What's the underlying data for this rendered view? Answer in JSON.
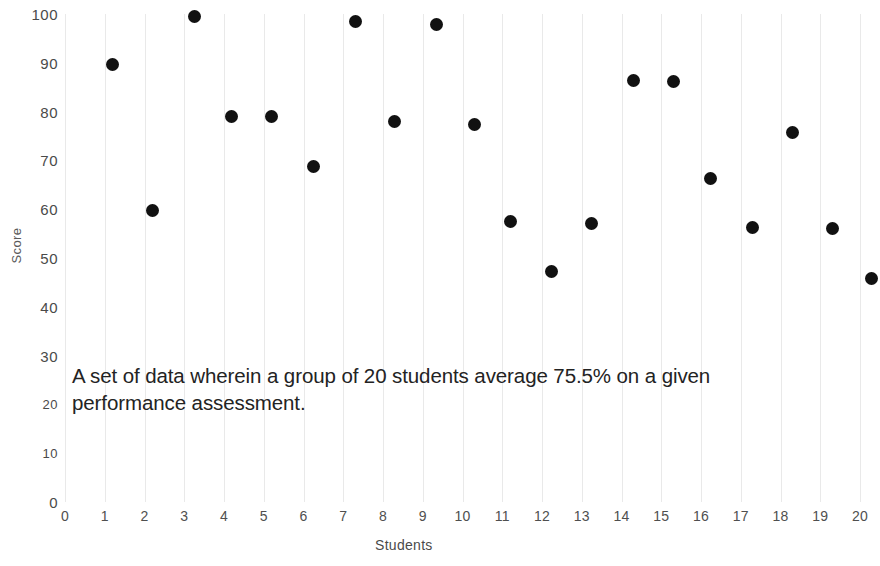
{
  "chart_data": {
    "type": "scatter",
    "title": "",
    "xlabel": "Students",
    "ylabel": "Score",
    "xlim": [
      0,
      20
    ],
    "ylim": [
      0,
      100
    ],
    "grid": "vertical",
    "legend": "none",
    "x_ticks": [
      "0",
      "1",
      "2",
      "3",
      "4",
      "5",
      "6",
      "7",
      "8",
      "9",
      "10",
      "11",
      "12",
      "13",
      "14",
      "15",
      "16",
      "17",
      "18",
      "19",
      "20"
    ],
    "y_ticks": [
      "0",
      "10",
      "20",
      "30",
      "40",
      "50",
      "60",
      "70",
      "80",
      "90",
      "100"
    ],
    "marker_color": "#111111",
    "gridline_color": "#e9e9e9",
    "series": [
      {
        "name": "Score",
        "x": [
          1.2,
          2.2,
          3.25,
          4.2,
          5.2,
          6.25,
          7.3,
          8.3,
          9.35,
          10.3,
          11.2,
          12.25,
          13.25,
          14.3,
          15.3,
          16.25,
          17.3,
          18.3,
          19.3,
          20.3
        ],
        "values": [
          89.7,
          59.8,
          99.5,
          79.0,
          78.9,
          68.8,
          98.5,
          77.9,
          97.9,
          77.4,
          57.5,
          47.2,
          57.0,
          86.4,
          86.1,
          66.3,
          56.3,
          75.7,
          56.0,
          45.8
        ]
      }
    ],
    "annotation": "A set of data wherein a group of 20 students average 75.5% on a given performance assessment."
  },
  "axis": {
    "y_title": "Score",
    "x_title": "Students"
  },
  "caption": {
    "text": "A set of data wherein a group of 20 students average 75.5% on a given performance assessment."
  }
}
